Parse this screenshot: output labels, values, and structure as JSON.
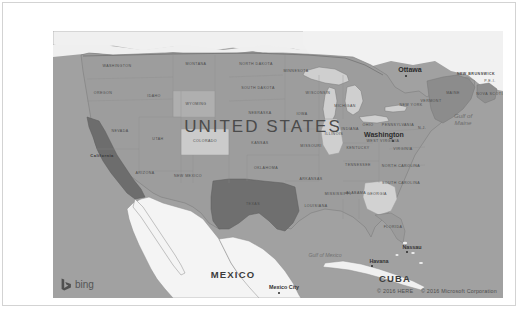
{
  "widget": {
    "type": "bing-map-embed",
    "provider_logo_text": "bing",
    "background_color": "#ffffff",
    "frame_border_color": "#d3d3d3"
  },
  "map": {
    "base_land_color": "#9f9f9f",
    "highlight_dark_color": "#6f6f6f",
    "highlight_light_color": "#cccccc",
    "water_color": "#f2f2f2",
    "border_color": "#7a7a7a",
    "country_label": "UNITED STATES",
    "neighbors": [
      "MEXICO",
      "CUBA"
    ],
    "states": [
      {
        "name": "WASHINGTON",
        "x": 64,
        "y": 35,
        "style": "state"
      },
      {
        "name": "OREGON",
        "x": 50,
        "y": 62,
        "style": "state"
      },
      {
        "name": "IDAHO",
        "x": 101,
        "y": 65,
        "style": "state"
      },
      {
        "name": "MONTANA",
        "x": 143,
        "y": 33,
        "style": "state"
      },
      {
        "name": "NORTH DAKOTA",
        "x": 203,
        "y": 33,
        "style": "state"
      },
      {
        "name": "SOUTH DAKOTA",
        "x": 205,
        "y": 57,
        "style": "state"
      },
      {
        "name": "WYOMING",
        "x": 143,
        "y": 73,
        "style": "state"
      },
      {
        "name": "NEVADA",
        "x": 67,
        "y": 100,
        "style": "state"
      },
      {
        "name": "California",
        "x": 49,
        "y": 124,
        "style": "state-bold"
      },
      {
        "name": "UTAH",
        "x": 105,
        "y": 108,
        "style": "state"
      },
      {
        "name": "COLORADO",
        "x": 152,
        "y": 110,
        "style": "state"
      },
      {
        "name": "NEBRASKA",
        "x": 207,
        "y": 82,
        "style": "state"
      },
      {
        "name": "KANSAS",
        "x": 207,
        "y": 112,
        "style": "state"
      },
      {
        "name": "ARIZONA",
        "x": 92,
        "y": 142,
        "style": "state"
      },
      {
        "name": "NEW MEXICO",
        "x": 135,
        "y": 145,
        "style": "state"
      },
      {
        "name": "OKLAHOMA",
        "x": 213,
        "y": 137,
        "style": "state"
      },
      {
        "name": "TEXAS",
        "x": 200,
        "y": 173,
        "style": "state"
      },
      {
        "name": "MINNESOTA",
        "x": 243,
        "y": 40,
        "style": "state"
      },
      {
        "name": "IOWA",
        "x": 249,
        "y": 83,
        "style": "state"
      },
      {
        "name": "MISSOURI",
        "x": 258,
        "y": 115,
        "style": "state"
      },
      {
        "name": "ARKANSAS",
        "x": 258,
        "y": 148,
        "style": "state"
      },
      {
        "name": "LOUISIANA",
        "x": 263,
        "y": 175,
        "style": "state"
      },
      {
        "name": "MISSISSIPPI",
        "x": 285,
        "y": 163,
        "style": "state"
      },
      {
        "name": "WISCONSIN",
        "x": 265,
        "y": 62,
        "style": "state"
      },
      {
        "name": "MICHIGAN",
        "x": 292,
        "y": 75,
        "style": "state"
      },
      {
        "name": "ILLINOIS",
        "x": 281,
        "y": 103,
        "style": "state"
      },
      {
        "name": "INDIANA",
        "x": 297,
        "y": 98,
        "style": "state"
      },
      {
        "name": "OHIO",
        "x": 315,
        "y": 94,
        "style": "state"
      },
      {
        "name": "KENTUCKY",
        "x": 305,
        "y": 117,
        "style": "state"
      },
      {
        "name": "TENNESSEE",
        "x": 305,
        "y": 134,
        "style": "state"
      },
      {
        "name": "ALABAMA",
        "x": 303,
        "y": 162,
        "style": "state"
      },
      {
        "name": "GEORGIA",
        "x": 324,
        "y": 163,
        "style": "state"
      },
      {
        "name": "FLORIDA",
        "x": 340,
        "y": 196,
        "style": "state"
      },
      {
        "name": "SOUTH CAROLINA",
        "x": 348,
        "y": 152,
        "style": "state"
      },
      {
        "name": "NORTH CAROLINA",
        "x": 348,
        "y": 135,
        "style": "state"
      },
      {
        "name": "VIRGINIA",
        "x": 350,
        "y": 118,
        "style": "state"
      },
      {
        "name": "WEST VIRGINIA",
        "x": 330,
        "y": 110,
        "style": "state"
      },
      {
        "name": "PENNSYLVANIA",
        "x": 345,
        "y": 94,
        "style": "state"
      },
      {
        "name": "NEW YORK",
        "x": 358,
        "y": 74,
        "style": "state"
      },
      {
        "name": "MAINE",
        "x": 400,
        "y": 62,
        "style": "state"
      },
      {
        "name": "VERMONT",
        "x": 378,
        "y": 70,
        "style": "state"
      },
      {
        "name": "N.J.",
        "x": 369,
        "y": 97,
        "style": "state"
      }
    ],
    "provinces": [
      {
        "name": "NEW BRUNSWICK",
        "x": 423,
        "y": 43,
        "style": "prov"
      },
      {
        "name": "NOVA SCOTIA",
        "x": 438,
        "y": 63,
        "style": "prov"
      },
      {
        "name": "P.E.I.",
        "x": 437,
        "y": 50,
        "style": "prov"
      }
    ],
    "cities": [
      {
        "name": "Ottawa",
        "x": 357,
        "y": 38,
        "dot_x": 353,
        "dot_y": 45,
        "style": "city"
      },
      {
        "name": "Washington",
        "x": 331,
        "y": 103,
        "dot_x": 340,
        "dot_y": 110,
        "style": "city"
      },
      {
        "name": "Mexico City",
        "x": 231,
        "y": 256,
        "dot_x": 226,
        "dot_y": 262,
        "style": "city-sm"
      },
      {
        "name": "Havana",
        "x": 326,
        "y": 230,
        "dot_x": 319,
        "dot_y": 235,
        "style": "city-sm"
      },
      {
        "name": "Nassau",
        "x": 359,
        "y": 216,
        "dot_x": 354,
        "dot_y": 221,
        "style": "city-sm"
      }
    ],
    "country_labels": [
      {
        "name": "UNITED STATES",
        "x": 210,
        "y": 96,
        "style": "country"
      },
      {
        "name": "MEXICO",
        "x": 180,
        "y": 243,
        "style": "country-sm"
      },
      {
        "name": "CUBA",
        "x": 342,
        "y": 247,
        "style": "country-sm"
      }
    ],
    "water_labels": [
      {
        "name": "Gulf of\nMaine",
        "x": 410,
        "y": 88,
        "style": "water"
      },
      {
        "name": "Gulf of Mexico",
        "x": 272,
        "y": 224,
        "style": "water"
      }
    ],
    "highlighted_states": {
      "dark": [
        "California",
        "Texas"
      ],
      "light": [
        "Colorado",
        "Georgia",
        "Illinois",
        "Wyoming"
      ]
    }
  },
  "attribution": {
    "here": "© 2016 HERE",
    "microsoft": "© 2016 Microsoft Corporation"
  }
}
